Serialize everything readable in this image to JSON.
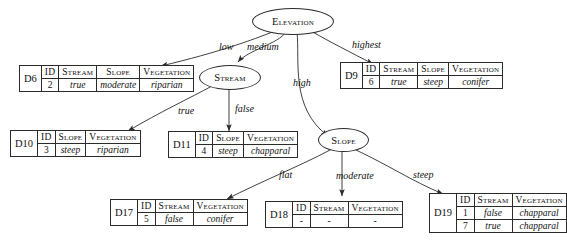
{
  "diagram": {
    "type": "decision-tree",
    "title": "",
    "nodes": [
      {
        "id": "elevation",
        "label": "Elevation"
      },
      {
        "id": "stream",
        "label": "Stream"
      },
      {
        "id": "slope",
        "label": "Slope"
      }
    ],
    "edges": [
      {
        "from": "elevation",
        "to": "D6",
        "label": "low"
      },
      {
        "from": "elevation",
        "to": "stream",
        "label": "medium"
      },
      {
        "from": "elevation",
        "to": "slope",
        "label": "high"
      },
      {
        "from": "elevation",
        "to": "D9",
        "label": "highest"
      },
      {
        "from": "stream",
        "to": "D10",
        "label": "true"
      },
      {
        "from": "stream",
        "to": "D11",
        "label": "false"
      },
      {
        "from": "slope",
        "to": "D17",
        "label": "flat"
      },
      {
        "from": "slope",
        "to": "D18",
        "label": "moderate"
      },
      {
        "from": "slope",
        "to": "D19",
        "label": "steep"
      }
    ],
    "tables": [
      {
        "name": "D6",
        "columns": [
          "ID",
          "Stream",
          "Slope",
          "Vegetation"
        ],
        "rows": [
          [
            "2",
            "true",
            "moderate",
            "riparian"
          ]
        ]
      },
      {
        "name": "D9",
        "columns": [
          "ID",
          "Stream",
          "Slope",
          "Vegetation"
        ],
        "rows": [
          [
            "6",
            "true",
            "steep",
            "conifer"
          ]
        ]
      },
      {
        "name": "D10",
        "columns": [
          "ID",
          "Slope",
          "Vegetation"
        ],
        "rows": [
          [
            "3",
            "steep",
            "riparian"
          ]
        ]
      },
      {
        "name": "D11",
        "columns": [
          "ID",
          "Slope",
          "Vegetation"
        ],
        "rows": [
          [
            "4",
            "steep",
            "chapparal"
          ]
        ]
      },
      {
        "name": "D17",
        "columns": [
          "ID",
          "Stream",
          "Vegetation"
        ],
        "rows": [
          [
            "5",
            "false",
            "conifer"
          ]
        ]
      },
      {
        "name": "D18",
        "columns": [
          "ID",
          "Stream",
          "Vegetation"
        ],
        "rows": [
          [
            "-",
            "-",
            "-"
          ]
        ]
      },
      {
        "name": "D19",
        "columns": [
          "ID",
          "Stream",
          "Vegetation"
        ],
        "rows": [
          [
            "1",
            "false",
            "chapparal"
          ],
          [
            "7",
            "true",
            "chapparal"
          ]
        ]
      }
    ],
    "colors": {
      "stroke": "#2b2b2b",
      "text": "#111111",
      "background": "#ffffff"
    }
  }
}
